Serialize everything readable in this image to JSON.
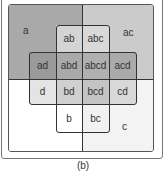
{
  "diagram": {
    "type": "karnaugh-style set diagram",
    "caption": "(b)",
    "sets": [
      "a",
      "b",
      "c",
      "d"
    ],
    "regions": {
      "a": "a",
      "ac": "ac",
      "ab": "ab",
      "abc": "abc",
      "ad": "ad",
      "abd": "abd",
      "abcd": "abcd",
      "acd": "acd",
      "d": "d",
      "bd": "bd",
      "bcd": "bcd",
      "cd": "cd",
      "b": "b",
      "bc": "bc",
      "c": "c"
    },
    "colors": {
      "a": "#a9a9a9",
      "ac": "#cbcbcb",
      "ab": "#d4d4d4",
      "abc": "#d9d9d9",
      "ad": "#9a9a9a",
      "abd": "#aaaaaa",
      "abcd": "#b0b0b0",
      "acd": "#aaaaaa",
      "d": "#e4e4e4",
      "bd": "#d0d0d0",
      "bcd": "#c4c4c4",
      "cd": "#d8d8d8",
      "b": "#ffffff",
      "bc": "#f2f2f2",
      "c": "#f3f3f3",
      "none": "#ffffff"
    }
  }
}
